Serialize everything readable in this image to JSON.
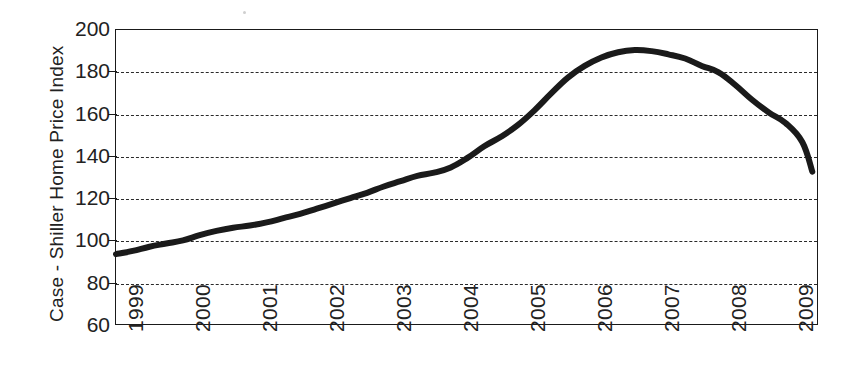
{
  "chart_data": {
    "type": "line",
    "title": "",
    "subtitle": "",
    "xlabel": "",
    "ylabel": "Case - Shiller Home Price Index",
    "xlim": [
      1999,
      2009.5
    ],
    "ylim": [
      60,
      200
    ],
    "yticks": [
      200,
      180,
      160,
      140,
      120,
      100,
      80,
      60
    ],
    "ytick_labels": [
      "200",
      "180",
      "160",
      "140",
      "120",
      "100",
      "80",
      "60"
    ],
    "xticks": [
      1999,
      2000,
      2001,
      2002,
      2003,
      2004,
      2005,
      2006,
      2007,
      2008,
      2009
    ],
    "xtick_labels": [
      "1999",
      "2000",
      "2001",
      "2002",
      "2003",
      "2004",
      "2005",
      "2006",
      "2007",
      "2008",
      "2009"
    ],
    "grid": true,
    "grid_style": "dashed-horizontal",
    "legend": null,
    "legend_position": "none",
    "series": [
      {
        "name": "Case-Shiller Home Price Index",
        "color": "#1a1a1a",
        "line_width": 6,
        "x": [
          1999.0,
          1999.25,
          1999.5,
          1999.75,
          2000.0,
          2000.25,
          2000.5,
          2000.75,
          2001.0,
          2001.25,
          2001.5,
          2001.75,
          2002.0,
          2002.25,
          2002.5,
          2002.75,
          2003.0,
          2003.25,
          2003.5,
          2003.75,
          2004.0,
          2004.25,
          2004.5,
          2004.75,
          2005.0,
          2005.25,
          2005.5,
          2005.75,
          2006.0,
          2006.25,
          2006.5,
          2006.75,
          2007.0,
          2007.25,
          2007.5,
          2007.75,
          2008.0,
          2008.25,
          2008.5,
          2008.75,
          2009.0,
          2009.25,
          2009.4
        ],
        "values": [
          94,
          95.5,
          97.5,
          99,
          100.5,
          103,
          105,
          106.5,
          107.5,
          109,
          111,
          113,
          115.5,
          118,
          120.5,
          123,
          126,
          128.5,
          131,
          132.5,
          135,
          139.5,
          145,
          149.5,
          155,
          162,
          170,
          177.5,
          183,
          187,
          189.5,
          190.5,
          190,
          188.5,
          186.5,
          183,
          180,
          174,
          167,
          161,
          156,
          147,
          133
        ]
      }
    ],
    "annotations": [],
    "data_notes": {
      "peak_value": 190.5,
      "peak_year": "mid-2006",
      "start_value": 94,
      "start_year": "1999",
      "end_value": 133,
      "end_year": "2009",
      "trough_after_peak": 129.5
    }
  },
  "figure": {
    "background_color": "#ffffff",
    "axis_color": "#1a1a1a",
    "text_color": "#222222",
    "line_color": "#1a1a1a"
  }
}
